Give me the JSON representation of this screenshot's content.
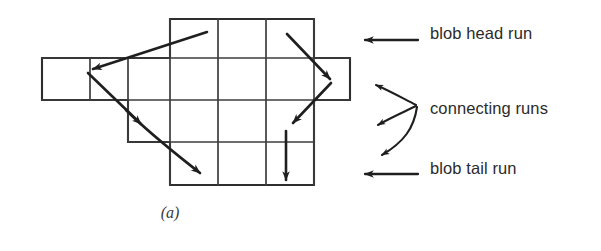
{
  "figure": {
    "caption": "(a)",
    "ink_color": "#1f1f1f",
    "grid_line_color": "#4a4a4a",
    "background_color": "#ffffff"
  },
  "legend": {
    "items": [
      {
        "id": "blob-head-run",
        "label": "blob head run",
        "marker": "left-arrow",
        "marker_count": 1
      },
      {
        "id": "connecting-runs",
        "label": "connecting runs",
        "marker": "three-pronged-left-arrow-brace",
        "marker_count": 3
      },
      {
        "id": "blob-tail-run",
        "label": "blob tail run",
        "marker": "left-arrow",
        "marker_count": 1
      }
    ]
  },
  "blob": {
    "description": "run-length encoded blob shown as a grid of pixel cells",
    "cell_width": 48,
    "cell_height": 42,
    "rows": [
      {
        "row": 0,
        "y_top": 19,
        "y_bottom": 58,
        "x_start": 170,
        "x_end": 314
      },
      {
        "row": 1,
        "y_top": 58,
        "y_bottom": 100,
        "x_start": 42,
        "x_end": 350
      },
      {
        "row": 2,
        "y_top": 100,
        "y_bottom": 142,
        "x_start": 128,
        "x_end": 314
      },
      {
        "row": 3,
        "y_top": 142,
        "y_bottom": 185,
        "x_start": 170,
        "x_end": 314
      }
    ],
    "vertical_dividers": [
      170,
      218,
      266,
      314,
      128,
      90,
      350
    ],
    "arrows": [
      {
        "id": "head-run-arrow",
        "kind": "blob-head-run",
        "from": [
          206,
          32
        ],
        "to": [
          90,
          70
        ]
      },
      {
        "id": "connecting-arrow-left",
        "kind": "connecting-run",
        "from": [
          90,
          72
        ],
        "to": [
          140,
          122
        ]
      },
      {
        "id": "tail-run-arrow-left",
        "kind": "blob-tail-run",
        "from": [
          130,
          112
        ],
        "to": [
          200,
          172
        ]
      },
      {
        "id": "connecting-arrow-right",
        "kind": "connecting-run",
        "from": [
          286,
          33
        ],
        "to": [
          330,
          78
        ]
      },
      {
        "id": "connecting-arrow-down",
        "kind": "connecting-run",
        "from": [
          328,
          82
        ],
        "to": [
          290,
          124
        ]
      },
      {
        "id": "tail-run-arrow-right",
        "kind": "blob-tail-run",
        "from": [
          285,
          128
        ],
        "to": [
          285,
          182
        ]
      }
    ]
  }
}
